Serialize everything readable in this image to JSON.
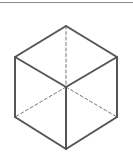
{
  "figure": {
    "title": "",
    "colors": {
      "edge": "#555555",
      "hidden_edge": "#777777",
      "rule": "#8a8a8a"
    },
    "vertices": {
      "top": [
        66,
        26
      ],
      "upper_left": [
        15,
        57
      ],
      "upper_right": [
        117,
        57
      ],
      "center": [
        66,
        87
      ],
      "lower_left": [
        15,
        117
      ],
      "lower_right": [
        117,
        117
      ],
      "bottom": [
        66,
        149
      ]
    },
    "solid_edges": [
      [
        "top",
        "upper_left"
      ],
      [
        "top",
        "upper_right"
      ],
      [
        "upper_left",
        "center"
      ],
      [
        "upper_right",
        "center"
      ],
      [
        "center",
        "bottom"
      ],
      [
        "upper_left",
        "lower_left"
      ],
      [
        "upper_right",
        "lower_right"
      ],
      [
        "lower_left",
        "bottom"
      ],
      [
        "lower_right",
        "bottom"
      ]
    ],
    "dashed_edges": [
      [
        "top",
        "center"
      ],
      [
        "center",
        "lower_left"
      ],
      [
        "center",
        "lower_right"
      ]
    ]
  }
}
